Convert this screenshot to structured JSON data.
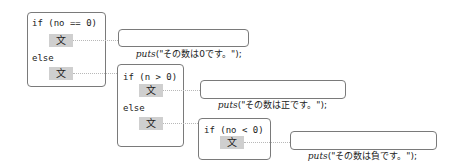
{
  "diagram": {
    "stmt_glyph": "文",
    "blocks": [
      {
        "cond": "if (no == 0)",
        "else": "else",
        "then_puts": {
          "fn": "puts",
          "arg": "(\"その数は0です。\");"
        }
      },
      {
        "cond": "if (n > 0)",
        "else": "else",
        "then_puts": {
          "fn": "puts",
          "arg": "(\"その数は正です。\");"
        }
      },
      {
        "cond": "if (no < 0)",
        "then_puts": {
          "fn": "puts",
          "arg": "(\"その数は負です。\");"
        }
      }
    ],
    "colors": {
      "border": "#7a7a7a",
      "stmt_fill": "#cfcfcf",
      "connector": "#b8b8b8"
    }
  }
}
